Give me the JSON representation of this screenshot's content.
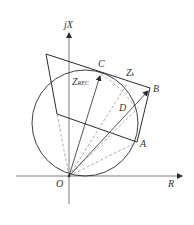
{
  "diagram": {
    "type": "impedance-plane",
    "axes": {
      "y_label": "jX",
      "x_label": "R",
      "origin_label": "O"
    },
    "points": {
      "A": "A",
      "B": "B",
      "C": "C",
      "D": "D"
    },
    "vectors": {
      "z_rec_main": "Z",
      "z_rec_sub": "REC",
      "z_k_main": "Z",
      "z_k_sub": "k"
    },
    "colors": {
      "line": "#2a2a2a",
      "dashed": "#8a8a8a",
      "background": "#ffffff"
    }
  }
}
